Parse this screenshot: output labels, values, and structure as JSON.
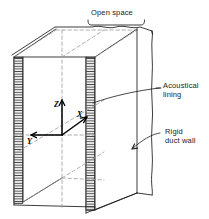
{
  "figure": {
    "background_color": "#ffffff",
    "line_color": "#1a1a1a",
    "hatch_color": "#555555"
  },
  "labels": {
    "open_space": "Open space",
    "acoustical_lining_line1": "Acoustical",
    "acoustical_lining_line2": "lining",
    "rigid_duct_wall_line1": "Rigid",
    "rigid_duct_wall_line2": "duct wall"
  },
  "axes": {
    "z": "Z",
    "x": "X",
    "y": "Y"
  },
  "parts": {
    "lining_left": "acoustical-lining-left",
    "lining_right": "acoustical-lining-right",
    "duct_wall": "rigid-duct-wall",
    "open_space_region": "open-space-channel"
  }
}
